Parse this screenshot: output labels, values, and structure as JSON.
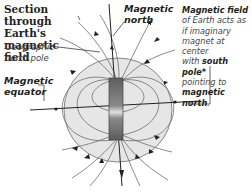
{
  "title": {
    "line1": "Section through",
    "line2": "Earth's magnetic",
    "line3": "field"
  },
  "labels": {
    "geographic_north_pole_line1": "Geographic",
    "geographic_north_pole_line2": "north pole",
    "magnetic_equator_line1": "Magnetic",
    "magnetic_equator_line2": "equator",
    "magnetic_north_line1": "Magnetic",
    "magnetic_north_line2": "north"
  },
  "description": {
    "heading": "Magnetic field",
    "line1": "of Earth acts as",
    "line2": "if imaginary",
    "line3": "magnet at center",
    "line4_prefix": "with ",
    "line4_bold": "south pole*",
    "line5": "pointing to",
    "line6_bold": "magnetic north",
    "line6_suffix": "."
  },
  "colors": {
    "globe_fill": "#e6e6e6",
    "field_line": "#6d6d6d",
    "axis_line": "#231f20",
    "magnet_dark": "#5e5e5e",
    "magnet_light": "#d8d8d8",
    "text": "#231f20"
  }
}
